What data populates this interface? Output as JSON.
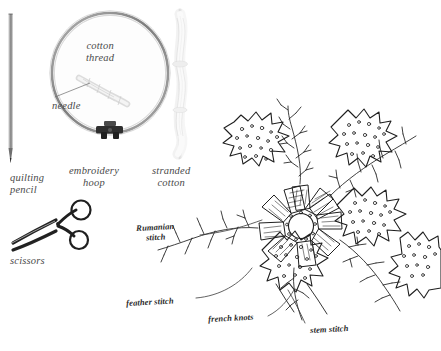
{
  "page": {
    "width": 441,
    "height": 351,
    "background": "#ffffff",
    "kind": "embroidery-materials-and-stitch-diagram"
  },
  "colors": {
    "ink": "#2a2a2a",
    "printed_label": "#4a4a4a",
    "hoop_ring": "#9a9a9a",
    "hoop_ring_dark": "#6e6e6e",
    "pencil_body": "#8d8d8d",
    "thread_pale": "#e2e2e2",
    "leader_line": "#6b6b6b",
    "background": "#ffffff"
  },
  "materials": {
    "section_title": "embroidery materials",
    "items": [
      {
        "id": "quilting-pencil",
        "label": "quilting\npencil",
        "x": 10,
        "y": 172
      },
      {
        "id": "embroidery-hoop",
        "label": "embroidery\nhoop",
        "x": 69,
        "y": 165
      },
      {
        "id": "stranded-cotton",
        "label": "stranded\ncotton",
        "x": 152,
        "y": 165
      },
      {
        "id": "scissors",
        "label": "scissors",
        "x": 10,
        "y": 255
      }
    ],
    "inner_labels": [
      {
        "id": "cotton-thread",
        "label": "cotton\nthread",
        "x": 86,
        "y": 40
      },
      {
        "id": "needle",
        "label": "needle",
        "x": 52,
        "y": 100
      }
    ]
  },
  "stitches": {
    "section_title": "stitch key",
    "items": [
      {
        "id": "rumanian-stitch",
        "label": "Rumanian\nstitch",
        "x": 136,
        "y": 224,
        "rotate": -3
      },
      {
        "id": "feather-stitch",
        "label": "feather stitch",
        "x": 126,
        "y": 299,
        "rotate": -3
      },
      {
        "id": "french-knots",
        "label": "french knots",
        "x": 208,
        "y": 315,
        "rotate": -3
      },
      {
        "id": "stem-stitch",
        "label": "stem stitch",
        "x": 310,
        "y": 326,
        "rotate": -3
      }
    ]
  },
  "design": {
    "id": "floral-embroidery-motif",
    "description": "maple-style leaves with french knot filling around a central radial flower worked in Rumanian stitch, with feather-stitched stems",
    "leaf_count": 5,
    "flower_petal_count": 10
  }
}
